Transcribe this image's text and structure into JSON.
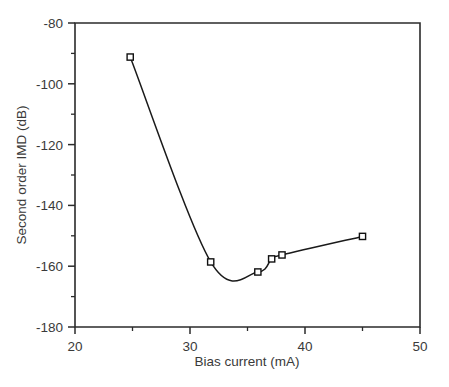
{
  "chart_data": {
    "type": "line",
    "title": "",
    "xlabel": "Bias current (mA)",
    "ylabel": "Second order IMD (dB)",
    "xlim": [
      20,
      50
    ],
    "ylim": [
      -180,
      -80
    ],
    "grid": false,
    "legend": null,
    "marker": "open-square",
    "line_color": "#1a1a1a",
    "x_major_ticks": [
      20,
      30,
      40,
      50
    ],
    "x_minor_ticks": [
      25,
      35,
      45
    ],
    "y_major_ticks": [
      -80,
      -100,
      -120,
      -140,
      -160,
      -180
    ],
    "y_minor_ticks": [
      -90,
      -110,
      -130,
      -150,
      -170
    ],
    "x_tick_labels": [
      "20",
      "30",
      "40",
      "50"
    ],
    "y_tick_labels": [
      "-80",
      "-100",
      "-120",
      "-140",
      "-160",
      "-180"
    ],
    "series": [
      {
        "name": "Second order IMD",
        "x": [
          24.8,
          31.8,
          35.9,
          37.1,
          38.0,
          45.0
        ],
        "values": [
          -91.2,
          -158.6,
          -161.9,
          -157.6,
          -156.3,
          -150.2
        ]
      }
    ]
  },
  "figure": {
    "background_color": "#ffffff",
    "axis_color": "#2b2b2b",
    "text_color": "#3a3a3a"
  }
}
